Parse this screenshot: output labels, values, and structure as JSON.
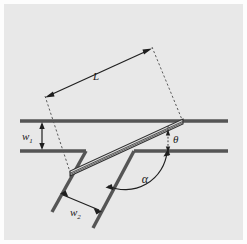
{
  "figure": {
    "caption": "",
    "background_color": "#e8e8e8",
    "line_color": "#4a4a4a",
    "annotation_color": "#1a1a1a",
    "plate_fill_color": "#dcdcdc"
  },
  "labels": {
    "length": "L",
    "gap_upper": "w",
    "gap_upper_sub": "1",
    "gap_lower": "w",
    "gap_lower_sub": "2",
    "angle_theta": "θ",
    "angle_alpha": "α"
  },
  "geometry": {
    "wall_upper": {
      "x1": 20,
      "y1": 121,
      "x2": 228,
      "y2": 121
    },
    "wall_lower_left": {
      "x1": 20,
      "y1": 151,
      "x2": 85,
      "y2": 151
    },
    "wall_lower_right": {
      "x1": 135,
      "y1": 151,
      "x2": 228,
      "y2": 151
    },
    "step_left_wall": {
      "x1": 85,
      "y1": 151,
      "x2": 52,
      "y2": 211
    },
    "step_right_wall": {
      "x1": 135,
      "y1": 151,
      "x2": 93,
      "y2": 227
    },
    "plate": {
      "left_end_x": 70,
      "left_end_y": 173,
      "right_end_x": 183,
      "right_end_y": 122,
      "thickness": 5
    },
    "dim_L": {
      "x1": 45,
      "y1": 97,
      "x2": 152,
      "y2": 48
    },
    "dim_w1": {
      "x": 42,
      "y1": 122,
      "y2": 150
    },
    "dim_w2": {
      "x1": 61,
      "y1": 194,
      "x2": 101,
      "y2": 211
    },
    "dim_theta": {
      "x": 168,
      "y1": 131,
      "y2": 150
    },
    "dashed_left": {
      "x1": 45,
      "y1": 97,
      "x2": 70,
      "y2": 173
    },
    "dashed_right": {
      "x1": 152,
      "y1": 48,
      "x2": 183,
      "y2": 122
    },
    "dashed_theta_vertical": {
      "x1": 168,
      "y1": 125,
      "x2": 168,
      "y2": 155
    },
    "arc_alpha": {
      "cx": 135,
      "cy": 151,
      "radius": 43
    }
  }
}
